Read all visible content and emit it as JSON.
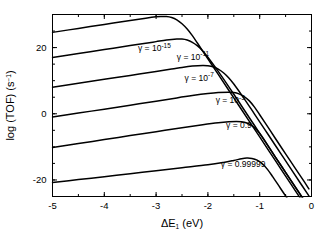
{
  "chart_data": {
    "type": "line",
    "title": "",
    "xlabel": "ΔE₁ (eV)",
    "ylabel": "log (TOF) (s⁻¹)",
    "xlim": [
      -5,
      0
    ],
    "ylim": [
      -25,
      30
    ],
    "xticks": [
      -5,
      -4,
      -3,
      -2,
      -1,
      0
    ],
    "xticklabels": [
      "-5",
      "-4",
      "-3",
      "-2",
      "-1",
      "0"
    ],
    "yticks": [
      -20,
      0,
      20
    ],
    "yticklabels": [
      "-20",
      "0",
      "20"
    ],
    "xminortick_step": 0.5,
    "yminortick_step": 5,
    "grid": false,
    "legend": "inline-labels",
    "series": [
      {
        "name": "gamma-1e-15",
        "label": "γ = 10",
        "label_exponent": "-15",
        "label_x": -3.35,
        "label_y": 19.0,
        "points": [
          [
            -5.0,
            24.6
          ],
          [
            -4.5,
            25.8
          ],
          [
            -4.0,
            27.0
          ],
          [
            -3.5,
            28.2
          ],
          [
            -3.2,
            28.9
          ],
          [
            -3.0,
            29.3
          ],
          [
            -2.9,
            29.4
          ],
          [
            -2.8,
            29.4
          ],
          [
            -2.7,
            29.1
          ],
          [
            -2.6,
            28.4
          ],
          [
            -2.5,
            27.2
          ],
          [
            -2.4,
            25.6
          ],
          [
            -2.3,
            23.6
          ],
          [
            -2.2,
            21.3
          ],
          [
            -2.0,
            16.6
          ],
          [
            -1.8,
            11.9
          ],
          [
            -1.5,
            4.8
          ],
          [
            -1.2,
            -2.3
          ],
          [
            -1.0,
            -7.0
          ],
          [
            -0.7,
            -14.1
          ],
          [
            -0.4,
            -21.2
          ],
          [
            -0.2,
            -25.9
          ],
          [
            -0.05,
            -29.4
          ]
        ]
      },
      {
        "name": "gamma-1e-11",
        "label": "γ = 10",
        "label_exponent": "-11",
        "label_x": -2.6,
        "label_y": 16.4,
        "points": [
          [
            -5.0,
            17.0
          ],
          [
            -4.5,
            18.2
          ],
          [
            -4.0,
            19.4
          ],
          [
            -3.5,
            20.6
          ],
          [
            -3.2,
            21.3
          ],
          [
            -3.0,
            21.8
          ],
          [
            -2.8,
            22.3
          ],
          [
            -2.6,
            22.6
          ],
          [
            -2.5,
            22.6
          ],
          [
            -2.4,
            22.3
          ],
          [
            -2.3,
            21.6
          ],
          [
            -2.2,
            20.5
          ],
          [
            -2.1,
            19.0
          ],
          [
            -2.0,
            17.1
          ],
          [
            -1.8,
            12.8
          ],
          [
            -1.5,
            5.9
          ],
          [
            -1.2,
            -1.2
          ],
          [
            -1.0,
            -5.9
          ],
          [
            -0.7,
            -13.0
          ],
          [
            -0.4,
            -20.1
          ],
          [
            -0.2,
            -24.8
          ],
          [
            -0.05,
            -28.3
          ]
        ]
      },
      {
        "name": "gamma-1e-7",
        "label": "γ = 10",
        "label_exponent": "-7",
        "label_x": -2.45,
        "label_y": 10.0,
        "points": [
          [
            -5.0,
            8.0
          ],
          [
            -4.5,
            9.2
          ],
          [
            -4.0,
            10.4
          ],
          [
            -3.5,
            11.6
          ],
          [
            -3.0,
            12.8
          ],
          [
            -2.7,
            13.5
          ],
          [
            -2.5,
            14.0
          ],
          [
            -2.3,
            14.4
          ],
          [
            -2.1,
            14.6
          ],
          [
            -2.0,
            14.5
          ],
          [
            -1.9,
            14.2
          ],
          [
            -1.8,
            13.5
          ],
          [
            -1.7,
            12.4
          ],
          [
            -1.6,
            10.9
          ],
          [
            -1.5,
            9.0
          ],
          [
            -1.3,
            4.6
          ],
          [
            -1.1,
            -0.1
          ],
          [
            -0.9,
            -4.8
          ],
          [
            -0.7,
            -9.5
          ],
          [
            -0.4,
            -16.6
          ],
          [
            -0.2,
            -21.3
          ],
          [
            -0.05,
            -24.8
          ]
        ]
      },
      {
        "name": "gamma-1e-3",
        "label": "γ = 10",
        "label_exponent": "-3",
        "label_x": -1.85,
        "label_y": 3.2,
        "points": [
          [
            -5.0,
            -1.0
          ],
          [
            -4.5,
            0.2
          ],
          [
            -4.0,
            1.4
          ],
          [
            -3.5,
            2.6
          ],
          [
            -3.0,
            3.8
          ],
          [
            -2.6,
            4.8
          ],
          [
            -2.3,
            5.5
          ],
          [
            -2.0,
            6.1
          ],
          [
            -1.8,
            6.4
          ],
          [
            -1.6,
            6.5
          ],
          [
            -1.5,
            6.4
          ],
          [
            -1.4,
            6.0
          ],
          [
            -1.3,
            5.2
          ],
          [
            -1.2,
            3.9
          ],
          [
            -1.1,
            2.0
          ],
          [
            -1.0,
            -0.3
          ],
          [
            -0.85,
            -3.8
          ],
          [
            -0.7,
            -7.4
          ],
          [
            -0.5,
            -12.1
          ],
          [
            -0.3,
            -16.8
          ],
          [
            -0.15,
            -20.3
          ],
          [
            -0.05,
            -22.7
          ]
        ]
      },
      {
        "name": "gamma-0.9",
        "label": "γ = 0.9",
        "label_exponent": "",
        "label_x": -1.65,
        "label_y": -4.2,
        "points": [
          [
            -5.0,
            -10.2
          ],
          [
            -4.5,
            -9.0
          ],
          [
            -4.0,
            -7.8
          ],
          [
            -3.5,
            -6.6
          ],
          [
            -3.0,
            -5.4
          ],
          [
            -2.5,
            -4.2
          ],
          [
            -2.1,
            -3.3
          ],
          [
            -1.8,
            -2.7
          ],
          [
            -1.6,
            -2.4
          ],
          [
            -1.45,
            -2.3
          ],
          [
            -1.35,
            -2.4
          ],
          [
            -1.25,
            -2.8
          ],
          [
            -1.15,
            -3.6
          ],
          [
            -1.05,
            -5.0
          ],
          [
            -0.95,
            -7.0
          ],
          [
            -0.85,
            -9.4
          ],
          [
            -0.7,
            -13.0
          ],
          [
            -0.5,
            -17.7
          ],
          [
            -0.3,
            -22.4
          ],
          [
            -0.15,
            -25.9
          ],
          [
            -0.05,
            -28.3
          ]
        ]
      },
      {
        "name": "gamma-0.99999",
        "label": "γ = 0.99999",
        "label_exponent": "",
        "label_x": -1.75,
        "label_y": -16.0,
        "points": [
          [
            -5.0,
            -20.8
          ],
          [
            -4.5,
            -19.9
          ],
          [
            -4.0,
            -19.0
          ],
          [
            -3.5,
            -18.1
          ],
          [
            -3.0,
            -17.2
          ],
          [
            -2.5,
            -16.3
          ],
          [
            -2.0,
            -15.4
          ],
          [
            -1.7,
            -14.7
          ],
          [
            -1.5,
            -14.1
          ],
          [
            -1.35,
            -13.6
          ],
          [
            -1.25,
            -13.4
          ],
          [
            -1.15,
            -13.5
          ],
          [
            -1.05,
            -14.0
          ],
          [
            -0.95,
            -15.1
          ],
          [
            -0.85,
            -16.8
          ],
          [
            -0.75,
            -19.0
          ],
          [
            -0.6,
            -22.5
          ],
          [
            -0.45,
            -26.0
          ],
          [
            -0.35,
            -28.4
          ],
          [
            -0.28,
            -30.0
          ]
        ]
      }
    ]
  }
}
